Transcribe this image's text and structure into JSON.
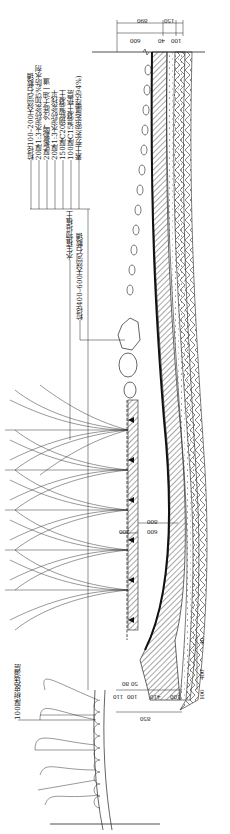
{
  "drawing": {
    "type": "landscape construction detail - pond edge cross-section (rotated 90°)",
    "orientation": "rotated 90 degrees counter-clockwise",
    "line_color": "#1a1a1a",
    "background": "#ffffff"
  },
  "layer_callouts": {
    "items": [
      "粒径100–200天然河石散铺",
      "20厚1:3水泥砂浆加5%防水剂",
      "2厚聚氨酯，冷底子油一道",
      "20厚1:3水泥砂浆找平",
      "150厚C20钢筋混凝土",
      "100厚C15混凝土垫层",
      "素土夯实(密实度需达94%)"
    ]
  },
  "mid_callouts": {
    "planting_soil": "水生植物培植土",
    "large_stones": "粒径400–600天然河石散铺"
  },
  "bottom_callout": {
    "bark_mulch": "100厚树皮保湿层"
  },
  "dimensions": {
    "top": {
      "overall": "890",
      "offset": "150",
      "seg_600": "600",
      "seg_40": "40",
      "seg_100": "100"
    },
    "middle": {
      "depth_800": "800",
      "depth_600": "600",
      "depth_200": "200"
    },
    "bottom": {
      "seg_50": "50",
      "seg_80": "80",
      "seg_110": "110",
      "seg_100a": "100",
      "seg_410": "410",
      "seg_100b": "100",
      "overall_850": "850",
      "v_400": "400",
      "v_40": "40",
      "v_100": "100"
    }
  }
}
